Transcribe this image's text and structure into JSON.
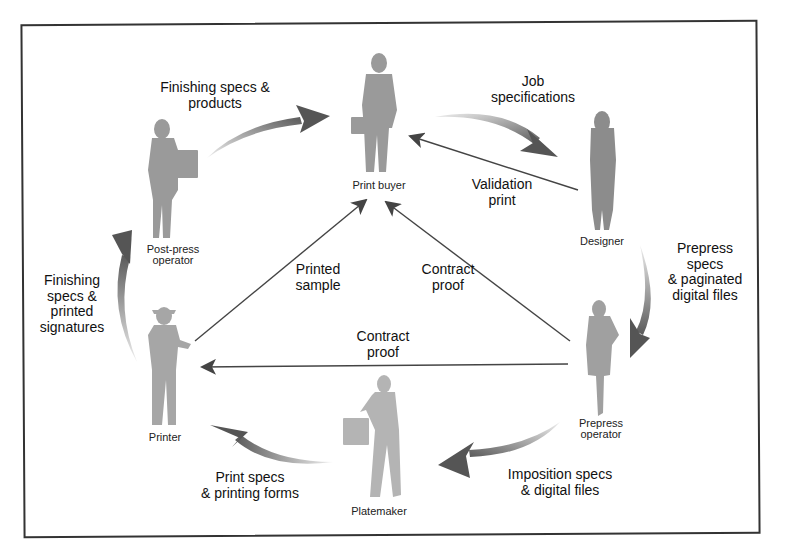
{
  "diagram": {
    "type": "print-production-workflow",
    "colors": {
      "frame": "#333333",
      "figure": "#9a9a9a",
      "figure_light": "#b4b4b4",
      "straight_arrow": "#444444",
      "curved_arrow_dark": "#555555",
      "curved_arrow_light": "#e6e6e6"
    },
    "roles": {
      "print_buyer": "Print buyer",
      "designer": "Designer",
      "prepress_operator_l1": "Prepress",
      "prepress_operator_l2": "operator",
      "platemaker": "Platemaker",
      "printer": "Printer",
      "post_press_operator_l1": "Post-press",
      "post_press_operator_l2": "operator"
    },
    "flows": {
      "job_specifications": {
        "l1": "Job",
        "l2": "specifications",
        "from": "Print buyer",
        "to": "Designer"
      },
      "validation_print": {
        "l1": "Validation",
        "l2": "print",
        "from": "Designer",
        "to": "Print buyer"
      },
      "prepress_specs": {
        "l1": "Prepress",
        "l2": "specs",
        "l3": "& paginated",
        "l4": "digital files",
        "from": "Designer",
        "to": "Prepress operator"
      },
      "contract_proof_to_buyer": {
        "l1": "Contract",
        "l2": "proof",
        "from": "Prepress operator",
        "to": "Print buyer"
      },
      "contract_proof_to_printer": {
        "l1": "Contract",
        "l2": "proof",
        "from": "Prepress operator",
        "to": "Printer"
      },
      "imposition_specs": {
        "l1": "Imposition specs",
        "l2": "& digital files",
        "from": "Prepress operator",
        "to": "Platemaker"
      },
      "print_specs": {
        "l1": "Print specs",
        "l2": "& printing forms",
        "from": "Platemaker",
        "to": "Printer"
      },
      "printed_sample": {
        "l1": "Printed",
        "l2": "sample",
        "from": "Printer",
        "to": "Print buyer"
      },
      "finishing_signatures": {
        "l1": "Finishing",
        "l2": "specs &",
        "l3": "printed",
        "l4": "signatures",
        "from": "Printer",
        "to": "Post-press operator"
      },
      "finishing_products": {
        "l1": "Finishing specs &",
        "l2": "products",
        "from": "Post-press operator",
        "to": "Print buyer"
      }
    }
  }
}
